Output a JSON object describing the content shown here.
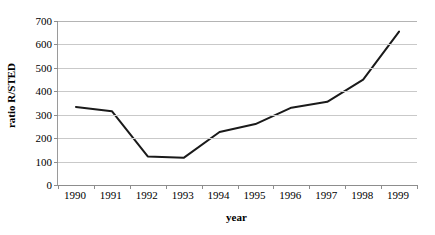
{
  "chart_data": {
    "type": "line",
    "title": "",
    "xlabel": "year",
    "ylabel": "ratio R/STED",
    "categories": [
      "1990",
      "1991",
      "1992",
      "1993",
      "1994",
      "1995",
      "1996",
      "1997",
      "1998",
      "1999"
    ],
    "x": [
      1990,
      1991,
      1992,
      1993,
      1994,
      1995,
      1996,
      1997,
      1998,
      1999
    ],
    "values": [
      333,
      315,
      122,
      116,
      226,
      260,
      330,
      355,
      450,
      655
    ],
    "series": [
      {
        "name": "ratio R/STED",
        "values": [
          333,
          315,
          122,
          116,
          226,
          260,
          330,
          355,
          450,
          655
        ],
        "color": "#1a1a1a"
      }
    ],
    "ylim": [
      0,
      700
    ],
    "yticks": [
      0,
      100,
      200,
      300,
      400,
      500,
      600,
      700
    ],
    "ytick_labels": [
      "0",
      "100",
      "200",
      "300",
      "400",
      "500",
      "600",
      "700"
    ],
    "xtick_labels": [
      "1990",
      "1991",
      "1992",
      "1993",
      "1994",
      "1995",
      "1996",
      "1997",
      "1998",
      "1999"
    ],
    "grid": "horizontal",
    "gridline_color": "#c9c9c9",
    "legend": "none",
    "background_color": "#ffffff",
    "axis_color": "#8d8d8d",
    "markers": "none",
    "line_width": 2
  }
}
